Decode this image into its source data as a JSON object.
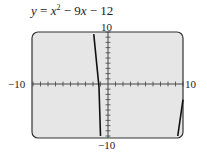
{
  "chart_data": {
    "type": "line",
    "title_parts": {
      "y": "y",
      "eq": " = ",
      "x1": "x",
      "sup": "2",
      "mid": " − 9",
      "x2": "x",
      "end": " − 12"
    },
    "xlim": [
      -10,
      10
    ],
    "ylim": [
      -10,
      10
    ],
    "tick_labels": {
      "x_min": "−10",
      "x_max": "10",
      "y_max": "10",
      "y_min": "−10"
    },
    "grid": false,
    "ticks_every": 1,
    "series": [
      {
        "name": "y = x^2 - 9x - 12",
        "segments": [
          {
            "x": [
              -1.9,
              -1.2,
              -1.0
            ],
            "y": [
              9.6,
              -0.6,
              -10
            ]
          },
          {
            "x": [
              9.3,
              10.0
            ],
            "y": [
              -10,
              -3.0
            ]
          }
        ]
      }
    ],
    "colors": {
      "plot_bg": "#e6e6e6",
      "frame": "#333333",
      "curve": "#111111"
    }
  }
}
